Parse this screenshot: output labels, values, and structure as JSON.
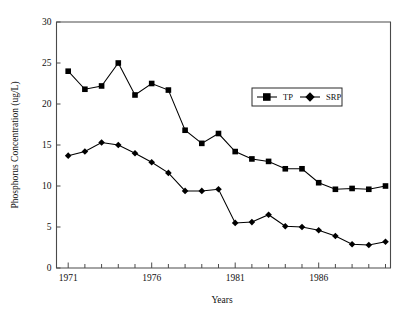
{
  "chart_data": {
    "type": "line",
    "title": "",
    "xlabel": "Years",
    "ylabel": "Phosphorus Concentration (ug/L)",
    "xlim": [
      1970.3,
      1990.3
    ],
    "ylim": [
      0,
      30
    ],
    "xticks": [
      1971,
      1976,
      1981,
      1986
    ],
    "xtick_labels": [
      "1971",
      "1976",
      "1981",
      "1986"
    ],
    "xticks_minor": [
      1972,
      1973,
      1974,
      1975,
      1977,
      1978,
      1979,
      1980,
      1982,
      1983,
      1984,
      1985,
      1987,
      1988,
      1989,
      1990
    ],
    "yticks": [
      0,
      5,
      10,
      15,
      20,
      25,
      30
    ],
    "ytick_labels": [
      "0",
      "5",
      "10",
      "15",
      "20",
      "25",
      "30"
    ],
    "grid": false,
    "legend_position": "upper right",
    "x": [
      1971,
      1972,
      1973,
      1974,
      1975,
      1976,
      1977,
      1978,
      1979,
      1980,
      1981,
      1982,
      1983,
      1984,
      1985,
      1986,
      1987,
      1988,
      1989,
      1990
    ],
    "series": [
      {
        "name": "TP",
        "marker": "square",
        "values": [
          24.0,
          21.8,
          22.2,
          25.0,
          21.1,
          22.5,
          21.7,
          16.8,
          15.2,
          16.4,
          14.2,
          13.3,
          13.0,
          12.1,
          12.1,
          10.4,
          9.6,
          9.7,
          9.6,
          10.0
        ]
      },
      {
        "name": "SRP",
        "marker": "diamond",
        "values": [
          13.7,
          14.2,
          15.3,
          15.0,
          14.0,
          12.9,
          11.6,
          9.4,
          9.4,
          9.6,
          5.5,
          5.6,
          6.5,
          5.1,
          5.0,
          4.6,
          3.9,
          2.9,
          2.8,
          3.2
        ]
      }
    ]
  },
  "legend": {
    "entries": [
      {
        "label": "TP"
      },
      {
        "label": "SRP"
      }
    ]
  },
  "colors": {
    "series": "#000000",
    "axis": "#4a4a4a",
    "text": "#101010",
    "background": "#ffffff"
  }
}
